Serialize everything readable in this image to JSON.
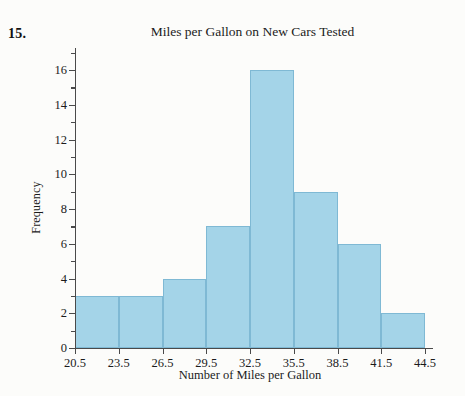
{
  "problem": {
    "number": "15."
  },
  "chart_data": {
    "type": "bar",
    "title": "Miles per Gallon on New Cars Tested",
    "xlabel": "Number of Miles per Gallon",
    "ylabel": "Frequency",
    "categories": [
      "20.5-23.5",
      "23.5-26.5",
      "26.5-29.5",
      "29.5-32.5",
      "32.5-35.5",
      "35.5-38.5",
      "38.5-41.5",
      "41.5-44.5"
    ],
    "bin_edges": [
      20.5,
      23.5,
      26.5,
      29.5,
      32.5,
      35.5,
      38.5,
      41.5,
      44.5
    ],
    "values": [
      3,
      3,
      4,
      7,
      16,
      9,
      6,
      2
    ],
    "xlim": [
      20.5,
      44.5
    ],
    "ylim": [
      0,
      16
    ],
    "x_ticks": [
      "20.5",
      "23.5",
      "26.5",
      "29.5",
      "32.5",
      "35.5",
      "38.5",
      "41.5",
      "44.5"
    ],
    "x_tick_values": [
      20.5,
      23.5,
      26.5,
      29.5,
      32.5,
      35.5,
      38.5,
      41.5,
      44.5
    ],
    "y_ticks": [
      "0",
      "2",
      "4",
      "6",
      "8",
      "10",
      "12",
      "14",
      "16"
    ],
    "y_tick_values": [
      0,
      2,
      4,
      6,
      8,
      10,
      12,
      14,
      16
    ],
    "y_minor_tick_values": [
      1,
      3,
      5,
      7,
      9,
      11,
      13,
      15,
      17
    ],
    "grid": false,
    "legend": "none",
    "bar_color": "#a4d4e8",
    "bar_border_color": "#7fb9d4",
    "axis_color": "#4a4a4a"
  }
}
